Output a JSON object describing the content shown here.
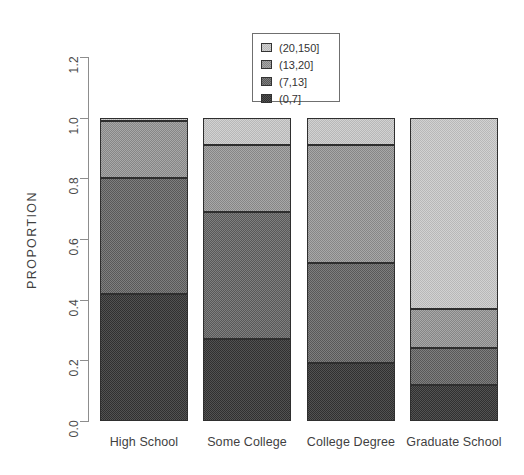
{
  "chart_data": {
    "type": "bar",
    "variant": "stacked-vertical-proportion",
    "title": "",
    "xlabel": "",
    "ylabel": "PROPORTION",
    "categories": [
      "High School",
      "Some College",
      "College Degree",
      "Graduate School"
    ],
    "ylim": [
      0.0,
      1.2
    ],
    "ytick_labels": [
      "0.0",
      "0.2",
      "0.4",
      "0.6",
      "0.8",
      "1.0",
      "1.2"
    ],
    "ytick_values": [
      0.0,
      0.2,
      0.4,
      0.6,
      0.8,
      1.0,
      1.2
    ],
    "grid": false,
    "legend_position": "top-center",
    "stack_order_bottom_to_top": [
      "(0,7]",
      "(7,13]",
      "(13,20]",
      "(20,150]"
    ],
    "series": [
      {
        "name": "(0,7]",
        "color": "#525252",
        "values": [
          0.42,
          0.27,
          0.19,
          0.12
        ]
      },
      {
        "name": "(7,13]",
        "color": "#7f7f7f",
        "values": [
          0.38,
          0.42,
          0.33,
          0.12
        ]
      },
      {
        "name": "(13,20]",
        "color": "#a8a8a8",
        "values": [
          0.19,
          0.22,
          0.39,
          0.13
        ]
      },
      {
        "name": "(20,150]",
        "color": "#d2d2d2",
        "values": [
          0.01,
          0.09,
          0.09,
          0.63
        ]
      }
    ],
    "cumulative_boundaries": [
      {
        "category": "High School",
        "edges": [
          0.0,
          0.42,
          0.8,
          0.99,
          1.0
        ]
      },
      {
        "category": "Some College",
        "edges": [
          0.0,
          0.27,
          0.69,
          0.91,
          1.0
        ]
      },
      {
        "category": "College Degree",
        "edges": [
          0.0,
          0.19,
          0.52,
          0.91,
          1.0
        ]
      },
      {
        "category": "Graduate School",
        "edges": [
          0.0,
          0.12,
          0.24,
          0.37,
          1.0
        ]
      }
    ]
  },
  "legend": {
    "items": [
      {
        "label": "(20,150]",
        "color": "#d2d2d2"
      },
      {
        "label": "(13,20]",
        "color": "#a8a8a8"
      },
      {
        "label": "(7,13]",
        "color": "#7f7f7f"
      },
      {
        "label": "(0,7]",
        "color": "#525252"
      }
    ]
  }
}
